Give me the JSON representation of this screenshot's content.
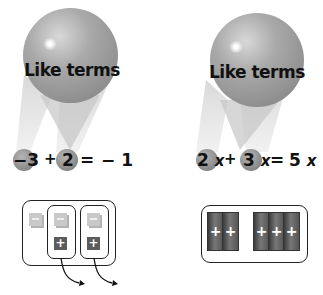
{
  "left": {
    "balloon_label": "Like terms",
    "equation": {
      "term1": "−3",
      "op1": "+",
      "term2": "2",
      "eq": "=",
      "result": "− 1"
    },
    "tiles": {
      "group_outer": [
        "minus"
      ],
      "pair1": [
        "minus",
        "plus"
      ],
      "pair2": [
        "minus",
        "plus"
      ],
      "minus_symbol": "−",
      "plus_symbol": "+"
    }
  },
  "right": {
    "balloon_label": "Like terms",
    "equation": {
      "term1_coef": "2",
      "term1_var": "x",
      "op1": "+",
      "term2_coef": "3",
      "term2_var": "x",
      "eq": "=",
      "result_coef": "5",
      "result_var": "x"
    },
    "tiles": {
      "group1": [
        "+",
        "+"
      ],
      "group2": [
        "+",
        "+",
        "+"
      ]
    }
  },
  "colors": {
    "balloon": "#9a9a9a",
    "tile_minus": "#c9c9c9",
    "tile_plus": "#5c5c5c",
    "bar": "#555555",
    "outline": "#222222"
  }
}
